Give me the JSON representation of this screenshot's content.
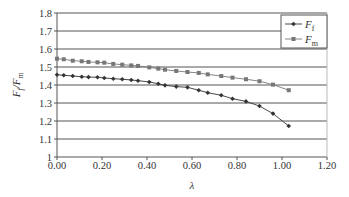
{
  "chart_data": {
    "type": "line",
    "title": "",
    "xlabel": "λ",
    "ylabel": "Ff / Fm",
    "xlim": [
      0,
      1.2
    ],
    "ylim": [
      1,
      1.8
    ],
    "x_ticks": [
      "0.00",
      "0.20",
      "0.40",
      "0.60",
      "0.80",
      "1.00",
      "1.20"
    ],
    "y_ticks": [
      "1",
      "1.1",
      "1.2",
      "1.3",
      "1.4",
      "1.5",
      "1.6",
      "1.7",
      "1.8"
    ],
    "grid": "horizontal",
    "legend_position": "top-right",
    "x": [
      0.0,
      0.03,
      0.07,
      0.11,
      0.14,
      0.18,
      0.21,
      0.25,
      0.29,
      0.33,
      0.36,
      0.41,
      0.45,
      0.48,
      0.53,
      0.58,
      0.63,
      0.67,
      0.73,
      0.78,
      0.84,
      0.9,
      0.96,
      1.03
    ],
    "series": [
      {
        "name": "Ff",
        "legend_main": "F",
        "legend_sub": "f",
        "marker": "diamond",
        "color": "#333333",
        "values": [
          1.457,
          1.454,
          1.45,
          1.446,
          1.444,
          1.443,
          1.439,
          1.435,
          1.432,
          1.428,
          1.424,
          1.417,
          1.407,
          1.398,
          1.391,
          1.387,
          1.371,
          1.357,
          1.343,
          1.324,
          1.309,
          1.283,
          1.241,
          1.172
        ]
      },
      {
        "name": "Fm",
        "legend_main": "F",
        "legend_sub": "m",
        "marker": "square",
        "color": "#777777",
        "values": [
          1.546,
          1.543,
          1.535,
          1.532,
          1.528,
          1.526,
          1.524,
          1.517,
          1.513,
          1.509,
          1.506,
          1.498,
          1.491,
          1.485,
          1.478,
          1.472,
          1.467,
          1.459,
          1.45,
          1.441,
          1.432,
          1.421,
          1.402,
          1.371
        ]
      }
    ]
  }
}
